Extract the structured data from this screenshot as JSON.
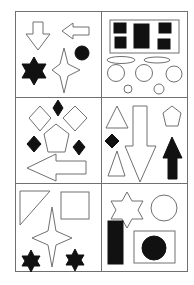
{
  "figure": {
    "stroke_color": "#707070",
    "fill_dark": "#111111",
    "fill_light": "#ffffff",
    "grid": {
      "rows": 3,
      "cols": 2
    },
    "panels": [
      {
        "id": "top-left",
        "shapes": [
          "outline down arrow",
          "outline left arrow",
          "filled circle",
          "filled six-point star",
          "outline four-point star"
        ]
      },
      {
        "id": "top-right",
        "shapes": [
          "outline rectangle with five filled squares",
          "two outline ellipses",
          "three outline circles",
          "two small outline circles"
        ]
      },
      {
        "id": "middle-left",
        "shapes": [
          "three filled diamonds",
          "two outline diamonds",
          "outline pentagon",
          "outline left arrow"
        ]
      },
      {
        "id": "middle-right",
        "shapes": [
          "outline triangle",
          "outline pentagon",
          "filled diamond",
          "outline triangle",
          "outline down arrow",
          "filled up arrow"
        ]
      },
      {
        "id": "bottom-left",
        "shapes": [
          "outline right triangle",
          "outline square",
          "outline four-point star",
          "two filled six-point stars"
        ]
      },
      {
        "id": "bottom-right",
        "shapes": [
          "outline six-point star",
          "outline circle",
          "filled rectangle",
          "outline rectangle with filled circle"
        ]
      }
    ]
  }
}
